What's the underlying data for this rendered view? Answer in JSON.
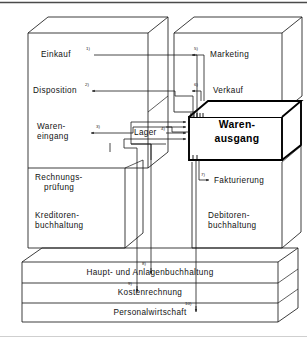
{
  "diagram": {
    "type": "block-flow-diagram",
    "colors": {
      "line": "#1a1a1a",
      "emphasis": "#000000",
      "background": "#ffffff",
      "frame": "#3c3c3c"
    },
    "blocks": {
      "left_upper": {
        "name": "Beschaffung",
        "labels": [
          {
            "text": "Einkauf",
            "marker": "1)"
          },
          {
            "text": "Disposition",
            "marker": "2)"
          }
        ]
      },
      "left_middle": {
        "labels": [
          {
            "line1": "Waren-",
            "line2": "eingang",
            "marker": "3)"
          }
        ]
      },
      "left_lower": {
        "labels": [
          {
            "line1": "Rechnungs-",
            "line2": "prüfung"
          },
          {
            "line1": "Kreditoren-",
            "line2": "buchhaltung"
          }
        ]
      },
      "right_upper": {
        "name": "Absatz",
        "labels": [
          {
            "text": "Marketing",
            "marker": "5)"
          },
          {
            "text": "Verkauf",
            "marker": "6)"
          }
        ]
      },
      "right_lower": {
        "labels": [
          {
            "text": "Fakturierung",
            "marker": "7)"
          },
          {
            "line1": "Debitoren-",
            "line2": "buchhaltung"
          }
        ]
      },
      "center": {
        "lager": {
          "text": "Lager",
          "marker": "4)"
        },
        "warenausgang": {
          "line1": "Waren-",
          "line2": "ausgang"
        }
      },
      "bottom_slabs": [
        {
          "text": "Haupt- und Anlagenbuchhaltung",
          "marker": "8)"
        },
        {
          "text": "Kostenrechnung",
          "marker": "9)"
        },
        {
          "text": "Personalwirtschaft",
          "marker": "10)"
        }
      ]
    },
    "connections": [
      {
        "id": "1)",
        "from": "Warenausgang",
        "to": "Einkauf"
      },
      {
        "id": "2)",
        "from": "Warenausgang",
        "to": "Disposition"
      },
      {
        "id": "3)",
        "from": "Warenausgang",
        "to": "Wareneingang"
      },
      {
        "id": "4)",
        "from": "Lager",
        "to": "Warenausgang"
      },
      {
        "id": "5)",
        "from": "Warenausgang",
        "to": "Marketing"
      },
      {
        "id": "6)",
        "from": "Warenausgang",
        "to": "Verkauf"
      },
      {
        "id": "7)",
        "from": "Warenausgang",
        "to": "Fakturierung"
      },
      {
        "id": "8)",
        "from": "Warenausgang",
        "to": "Haupt- und Anlagenbuchhaltung"
      },
      {
        "id": "9)",
        "from": "Warenausgang",
        "to": "Kostenrechnung"
      },
      {
        "id": "10)",
        "from": "Warenausgang",
        "to": "Personalwirtschaft"
      }
    ]
  }
}
